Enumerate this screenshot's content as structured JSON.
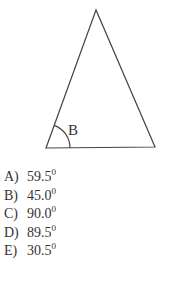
{
  "figure": {
    "type": "triangle",
    "vertices": {
      "apex": [
        96,
        10
      ],
      "bottom_left": [
        46,
        148
      ],
      "bottom_right": [
        155,
        147
      ]
    },
    "angle_label": "B",
    "angle_marker": "arc"
  },
  "question": {
    "options": [
      {
        "letter": "A)",
        "value": "59.5",
        "unit": "0"
      },
      {
        "letter": "B)",
        "value": "45.0",
        "unit": "0"
      },
      {
        "letter": "C)",
        "value": "90.0",
        "unit": "0"
      },
      {
        "letter": "D)",
        "value": "89.5",
        "unit": "0"
      },
      {
        "letter": "E)",
        "value": "30.5",
        "unit": "0"
      }
    ]
  }
}
